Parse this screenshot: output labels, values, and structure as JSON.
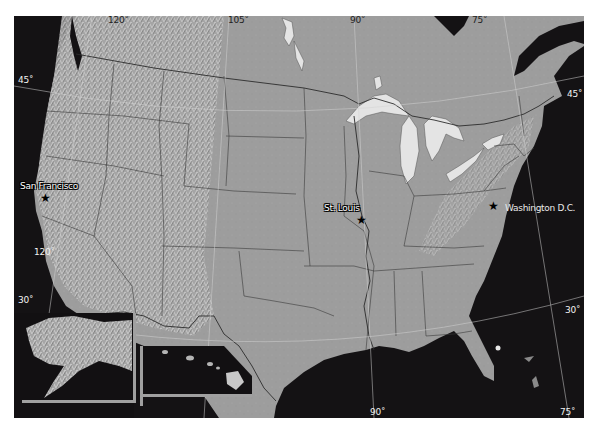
{
  "map": {
    "title": "",
    "projection_graticule": {
      "longitude_labels_top": [
        "120˚",
        "105˚",
        "90˚",
        "75˚"
      ],
      "longitude_labels_bottom": [
        "120˚",
        "90˚",
        "75˚"
      ],
      "latitude_labels": [
        "45˚",
        "45˚",
        "30˚",
        "30˚"
      ]
    },
    "cities": [
      {
        "name": "San Francisco"
      },
      {
        "name": "St. Louis"
      },
      {
        "name": "Washington D.C."
      }
    ],
    "insets": [
      {
        "name": "Alaska inset"
      },
      {
        "name": "Hawaii inset"
      }
    ],
    "colors": {
      "ocean": "#141214",
      "land": "#9c9c9c",
      "lakes": "#e6e6e6",
      "borders": "#3a3a3a",
      "graticule": "#d8d8d8",
      "inset_frame": "#a0a0a0"
    }
  }
}
